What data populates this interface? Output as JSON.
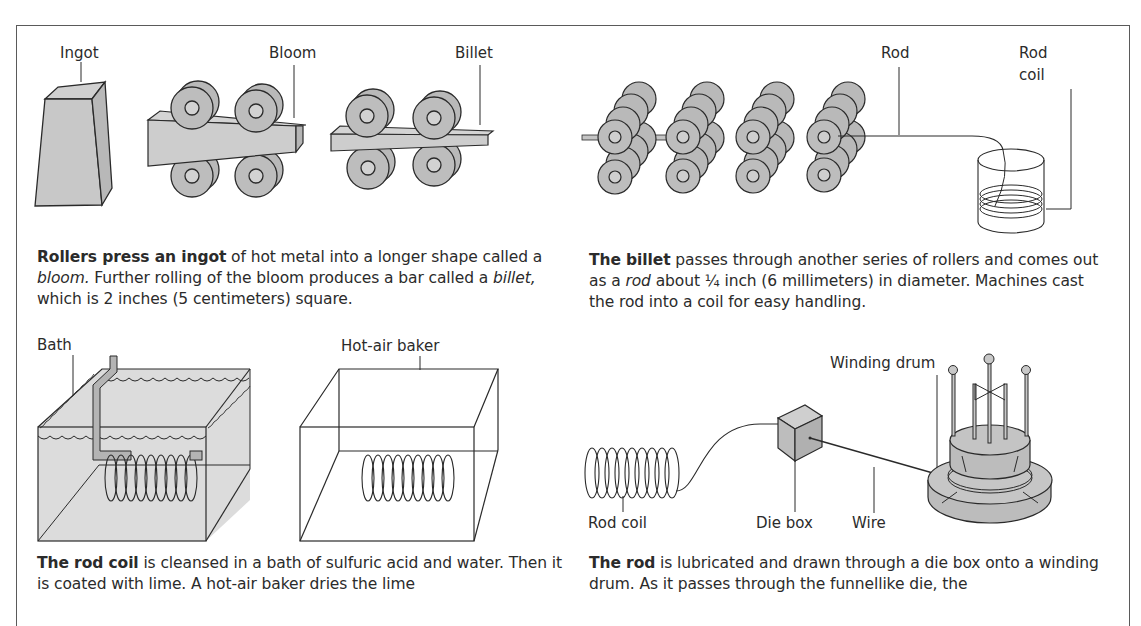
{
  "figure": {
    "panels": [
      {
        "id": "rolling",
        "labels": [
          "Ingot",
          "Bloom",
          "Billet"
        ],
        "caption_lead": "Rollers press an ingot",
        "caption_parts": [
          " of hot metal into a longer shape called a ",
          "bloom.",
          " Further rolling of the bloom produces a bar called a ",
          "billet,",
          " which is 2 inches (5 centimeters) square."
        ]
      },
      {
        "id": "rod",
        "labels": [
          "Rod",
          "Rod coil"
        ],
        "label_lines": [
          "Rod",
          "coil"
        ],
        "caption_lead": "The billet",
        "caption_parts": [
          " passes through another series of rollers and comes out as a ",
          "rod",
          " about ¼ inch (6 millimeters) in diameter. Machines cast the rod into a coil for easy handling."
        ]
      },
      {
        "id": "cleaning",
        "labels": [
          "Bath",
          "Hot-air baker"
        ],
        "caption_lead": "The rod coil",
        "caption_parts": [
          " is cleansed in a bath of sulfuric acid and water. Then it is coated with lime. A hot-air baker dries the lime"
        ]
      },
      {
        "id": "drawing",
        "labels": [
          "Winding drum",
          "Rod coil",
          "Die box",
          "Wire"
        ],
        "caption_lead": "The rod",
        "caption_parts": [
          " is lubricated and drawn through a die box onto a winding drum. As it passes through the funnellike die, the"
        ]
      }
    ],
    "colors": {
      "fill_gray": "#c8c8c8",
      "roller_gray": "#b9b9b9",
      "bath_gray": "#dcdcdc",
      "line": "#2a2a2a",
      "frame": "#5a5a5a"
    }
  }
}
